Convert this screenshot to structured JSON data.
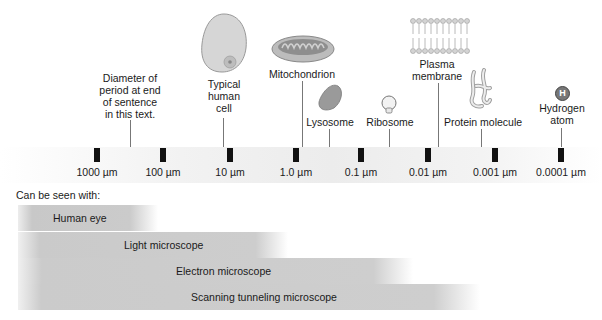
{
  "diagram": {
    "scale_ticks": [
      {
        "label": "1000 µm",
        "x": 97
      },
      {
        "label": "100 µm",
        "x": 163
      },
      {
        "label": "10 µm",
        "x": 230
      },
      {
        "label": "1.0 µm",
        "x": 296
      },
      {
        "label": "0.1 µm",
        "x": 361
      },
      {
        "label": "0.01 µm",
        "x": 428
      },
      {
        "label": "0.001 µm",
        "x": 495
      },
      {
        "label": "0.0001 µm",
        "x": 561
      }
    ],
    "objects": [
      {
        "name": "period",
        "label_lines": [
          "Diameter of",
          "period at end",
          "of sentence",
          "in this text."
        ]
      },
      {
        "name": "cell",
        "label_lines": [
          "Typical",
          "human",
          "cell"
        ]
      },
      {
        "name": "mitochondrion",
        "label_lines": [
          "Mitochondrion"
        ]
      },
      {
        "name": "lysosome",
        "label_lines": [
          "Lysosome"
        ]
      },
      {
        "name": "ribosome",
        "label_lines": [
          "Ribosome"
        ]
      },
      {
        "name": "plasma-membrane",
        "label_lines": [
          "Plasma",
          "membrane"
        ]
      },
      {
        "name": "protein",
        "label_lines": [
          "Protein molecule"
        ]
      },
      {
        "name": "hydrogen",
        "label_lines": [
          "Hydrogen",
          "atom"
        ],
        "symbol": "H"
      }
    ],
    "seen_with_heading": "Can be seen with:",
    "instruments": [
      {
        "label": "Human eye"
      },
      {
        "label": "Light microscope"
      },
      {
        "label": "Electron microscope"
      },
      {
        "label": "Scanning tunneling microscope"
      }
    ]
  }
}
